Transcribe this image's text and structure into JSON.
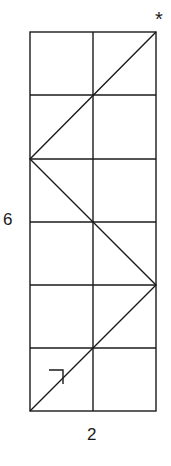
{
  "diagram": {
    "grid": {
      "columns": 2,
      "rows": 6
    },
    "labels": {
      "height": "6",
      "width": "2",
      "end_marker": "*"
    },
    "path": {
      "description": "Zigzag diagonal path from bottom-left corner bouncing between left and right edges up to top-right corner",
      "points_grid": [
        [
          0,
          0
        ],
        [
          2,
          2
        ],
        [
          0,
          4
        ],
        [
          2,
          6
        ]
      ],
      "start_arrow": "up-right"
    },
    "colors": {
      "line": "#1a1a1a",
      "background": "#ffffff"
    }
  }
}
